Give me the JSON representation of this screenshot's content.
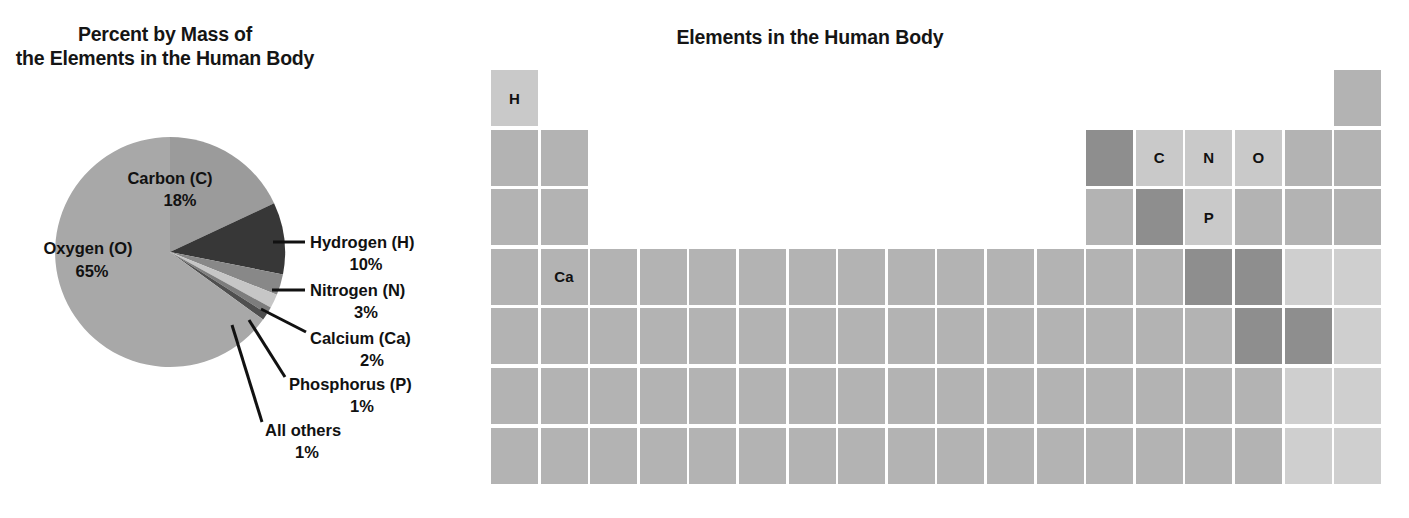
{
  "pie": {
    "title_line1": "Percent by Mass of",
    "title_line2": "the Elements in the Human Body",
    "labels": {
      "oxygen_name": "Oxygen (O)",
      "oxygen_pct": "65%",
      "carbon_name": "Carbon (C)",
      "carbon_pct": "18%",
      "hydrogen_name": "Hydrogen (H)",
      "hydrogen_pct": "10%",
      "nitrogen_name": "Nitrogen (N)",
      "nitrogen_pct": "3%",
      "calcium_name": "Calcium (Ca)",
      "calcium_pct": "2%",
      "phosphorus_name": "Phosphorus (P)",
      "phosphorus_pct": "1%",
      "allothers_name": "All others",
      "allothers_pct": "1%"
    }
  },
  "periodic_table": {
    "title": "Elements in the Human Body",
    "legend_colors": {
      "highlight": "#c9c9c9",
      "normal": "#b3b3b3",
      "dark": "#8e8e8e",
      "light": "#cfcfcf"
    },
    "labelled_cells": {
      "h": "H",
      "ca": "Ca",
      "c": "C",
      "n": "N",
      "o": "O",
      "p": "P"
    }
  },
  "chart_data": {
    "type": "pie",
    "title": "Percent by Mass of the Elements in the Human Body",
    "unit": "percent by mass",
    "legend": "labels-with-leader-lines",
    "categories": [
      "Oxygen (O)",
      "Carbon (C)",
      "Hydrogen (H)",
      "Nitrogen (N)",
      "Calcium (Ca)",
      "Phosphorus (P)",
      "All others"
    ],
    "values": [
      65,
      18,
      10,
      3,
      2,
      1,
      1
    ],
    "symbols": [
      "O",
      "C",
      "H",
      "N",
      "Ca",
      "P",
      ""
    ],
    "value_labels": [
      "65%",
      "18%",
      "10%",
      "3%",
      "2%",
      "1%",
      "1%"
    ],
    "colors": [
      "#a8a8a8",
      "#9b9b9b",
      "#3a3a3a",
      "#8c8c8c",
      "#c6c6c6",
      "#808080",
      "#5a5a5a"
    ],
    "start_angle_deg": 0,
    "direction": "clockwise",
    "total": 100
  }
}
